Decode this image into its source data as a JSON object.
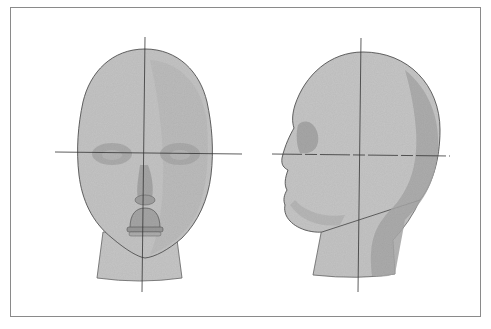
{
  "illustration": {
    "subject": "head proportions study",
    "views": [
      "front-view",
      "profile-view"
    ],
    "colors": {
      "frame": "#8a8a8a",
      "skin_light": "#c9c9c9",
      "skin_mid": "#b3b3b3",
      "skin_dark": "#9c9c9c",
      "outline": "#555555",
      "guide_line": "#333333"
    }
  }
}
